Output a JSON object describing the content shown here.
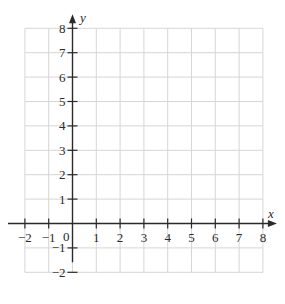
{
  "chart_data": {
    "type": "scatter",
    "title": "",
    "xlabel": "x",
    "ylabel": "y",
    "xlim": [
      -2,
      8
    ],
    "ylim": [
      -2,
      8
    ],
    "grid": true,
    "x_ticks": [
      -2,
      -1,
      1,
      2,
      3,
      4,
      5,
      6,
      7,
      8
    ],
    "y_ticks": [
      -2,
      -1,
      1,
      2,
      3,
      4,
      5,
      6,
      7,
      8
    ],
    "x_tick_labels": [
      "−2",
      "−1",
      "1",
      "2",
      "3",
      "4",
      "5",
      "6",
      "7",
      "8"
    ],
    "y_tick_labels": [
      "−2",
      "−1",
      "1",
      "2",
      "3",
      "4",
      "5",
      "6",
      "7",
      "8"
    ],
    "origin_label": "0",
    "series": [],
    "colors": {
      "grid": "#d6d6d6",
      "axis": "#2a2a2a"
    }
  }
}
